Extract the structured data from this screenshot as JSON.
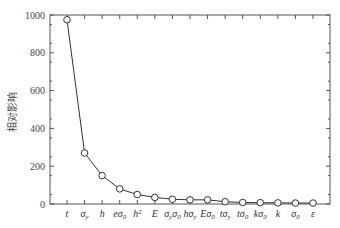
{
  "chart_data": {
    "type": "line",
    "title": "",
    "xlabel": "",
    "ylabel": "相对影响",
    "ylim": [
      0,
      1000
    ],
    "yticks": [
      0,
      200,
      400,
      600,
      800,
      1000
    ],
    "grid": false,
    "legend": null,
    "marker": "open-circle",
    "categories": [
      "t",
      "σy",
      "h",
      "eσ0",
      "h²",
      "E",
      "σyσ0",
      "hσy",
      "Eσ0",
      "tσy",
      "tσ0",
      "kσ0",
      "k",
      "σ0",
      "ε"
    ],
    "category_display": [
      {
        "base": "t",
        "sub": ""
      },
      {
        "base": "σ",
        "sub": "y"
      },
      {
        "base": "h",
        "sub": ""
      },
      {
        "base": "eσ",
        "sub": "0"
      },
      {
        "base": "h²",
        "sub": ""
      },
      {
        "base": "E",
        "sub": ""
      },
      {
        "base": "σ",
        "sub": "y",
        "base2": "σ",
        "sub2": "0"
      },
      {
        "base": "hσ",
        "sub": "y"
      },
      {
        "base": "Eσ",
        "sub": "0"
      },
      {
        "base": "tσ",
        "sub": "y"
      },
      {
        "base": "tσ",
        "sub": "0"
      },
      {
        "base": "kσ",
        "sub": "0"
      },
      {
        "base": "k",
        "sub": ""
      },
      {
        "base": "σ",
        "sub": "0"
      },
      {
        "base": "ε",
        "sub": ""
      }
    ],
    "series": [
      {
        "name": "相对影响",
        "values": [
          975,
          270,
          150,
          80,
          50,
          35,
          25,
          22,
          22,
          12,
          8,
          7,
          6,
          5,
          5
        ]
      }
    ]
  },
  "colors": {
    "line": "#333333",
    "axis": "#555555",
    "marker_fill": "#ffffff"
  }
}
